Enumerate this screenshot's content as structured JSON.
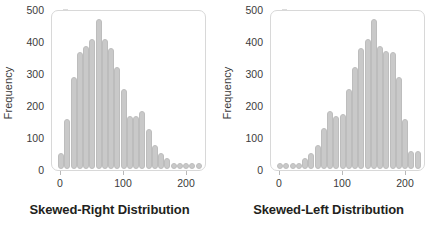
{
  "chart_data": [
    {
      "type": "bar",
      "title": "Skewed-Right Distribution",
      "xlabel": "",
      "ylabel": "Frequency",
      "xlim": [
        -5,
        232
      ],
      "ylim": [
        0,
        530
      ],
      "yticks": [
        0,
        100,
        200,
        300,
        400,
        500
      ],
      "xticks": [
        0,
        100,
        200
      ],
      "grid": false,
      "legend": "none",
      "bar_color": "#c9c9c9",
      "bar_edge_color": "#bdbdbd",
      "bin_width": 10,
      "x": [
        5,
        15,
        25,
        35,
        45,
        55,
        65,
        75,
        85,
        95,
        105,
        115,
        125,
        135,
        145,
        155,
        165,
        175,
        185,
        195,
        205,
        215,
        225
      ],
      "values": [
        55,
        170,
        310,
        395,
        415,
        440,
        505,
        440,
        410,
        345,
        270,
        180,
        180,
        195,
        135,
        80,
        55,
        38,
        12,
        8,
        8,
        8,
        8
      ]
    },
    {
      "type": "bar",
      "title": "Skewed-Left Distribution",
      "xlabel": "",
      "ylabel": "Frequency",
      "xlim": [
        -5,
        232
      ],
      "ylim": [
        0,
        530
      ],
      "yticks": [
        0,
        100,
        200,
        300,
        400,
        500
      ],
      "xticks": [
        0,
        100,
        200
      ],
      "grid": false,
      "legend": "none",
      "bar_color": "#c9c9c9",
      "bar_edge_color": "#bdbdbd",
      "bin_width": 10,
      "x": [
        5,
        15,
        25,
        35,
        45,
        55,
        65,
        75,
        85,
        95,
        105,
        115,
        125,
        135,
        145,
        155,
        165,
        175,
        185,
        195,
        205,
        215,
        225
      ],
      "values": [
        8,
        8,
        8,
        12,
        38,
        55,
        80,
        140,
        195,
        180,
        185,
        270,
        345,
        410,
        440,
        505,
        415,
        400,
        395,
        310,
        170,
        60,
        60
      ]
    }
  ],
  "panels": [
    {
      "id": "skewed-right",
      "caption": "Skewed-Right Distribution",
      "ylabel": "Frequency",
      "ytick_labels": [
        "500",
        "400",
        "300",
        "200",
        "100",
        "0"
      ],
      "xtick_labels": [
        "0",
        "100",
        "200"
      ]
    },
    {
      "id": "skewed-left",
      "caption": "Skewed-Left Distribution",
      "ylabel": "Frequency",
      "ytick_labels": [
        "500",
        "400",
        "300",
        "200",
        "100",
        "0"
      ],
      "xtick_labels": [
        "0",
        "100",
        "200"
      ]
    }
  ],
  "colors": {
    "bar_fill": "#c9c9c9",
    "bar_edge": "#bdbdbd",
    "frame": "#d8d8d8",
    "tick_text": "#3b3b3b",
    "caption_text": "#231f20",
    "background": "#ffffff"
  }
}
